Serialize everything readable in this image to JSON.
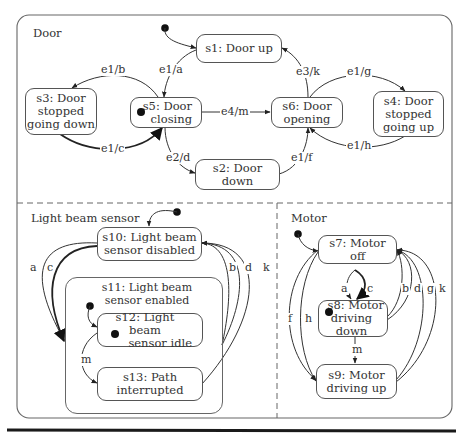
{
  "regions": {
    "door": "Door",
    "light_beam_sensor": "Light beam sensor",
    "motor": "Motor"
  },
  "states": {
    "s1": "s1: Door up",
    "s2": "s2: Door down",
    "s3_line1": "s3: Door",
    "s3_line2": "stopped",
    "s3_line3": "going down",
    "s4_line1": "s4: Door",
    "s4_line2": "stopped",
    "s4_line3": "going up",
    "s5_line1": "s5: Door",
    "s5_line2": "closing",
    "s6_line1": "s6: Door",
    "s6_line2": "opening",
    "s7_line1": "s7: Motor",
    "s7_line2": "off",
    "s8_line1": "s8: Motor",
    "s8_line2": "driving down",
    "s9_line1": "s9: Motor",
    "s9_line2": "driving up",
    "s10_line1": "s10: Light beam",
    "s10_line2": "sensor disabled",
    "s11_line1": "s11: Light beam",
    "s11_line2": "sensor enabled",
    "s12_line1": "s12: Light beam",
    "s12_line2": "sensor idle",
    "s13_line1": "s13: Path",
    "s13_line2": "interrupted"
  },
  "transitions": {
    "door": {
      "s1_to_s5": "e1/a",
      "s5_to_s3": "e1/b",
      "s3_to_s5": "e1/c",
      "s5_to_s2": "e2/d",
      "s5_to_s6": "e4/m",
      "s2_to_s6": "e1/f",
      "s6_to_s4": "e1/g",
      "s4_to_s6": "e1/h",
      "s6_to_s1": "e3/k"
    },
    "light_beam_sensor": {
      "a": "a",
      "c": "c",
      "b": "b",
      "d": "d",
      "k": "k",
      "m": "m"
    },
    "motor": {
      "a": "a",
      "c": "c",
      "b": "b",
      "d": "d",
      "g": "g",
      "k": "k",
      "f": "f",
      "h": "h",
      "m": "m"
    }
  },
  "colors": {
    "line": "#444444",
    "border": "#555555",
    "dashed": "#666666",
    "text": "#333333",
    "bottom_rule": "#1a1a1a"
  }
}
